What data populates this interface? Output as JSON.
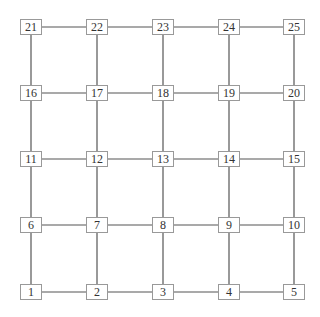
{
  "diagram": {
    "type": "grid-graph",
    "rows": 5,
    "cols": 5,
    "col_x": [
      31,
      97,
      163,
      229,
      294
    ],
    "row_y": [
      292,
      225,
      159,
      93,
      27
    ],
    "edge_color": "#555555",
    "nodes": [
      "1",
      "2",
      "3",
      "4",
      "5",
      "6",
      "7",
      "8",
      "9",
      "10",
      "11",
      "12",
      "13",
      "14",
      "15",
      "16",
      "17",
      "18",
      "19",
      "20",
      "21",
      "22",
      "23",
      "24",
      "25"
    ]
  }
}
